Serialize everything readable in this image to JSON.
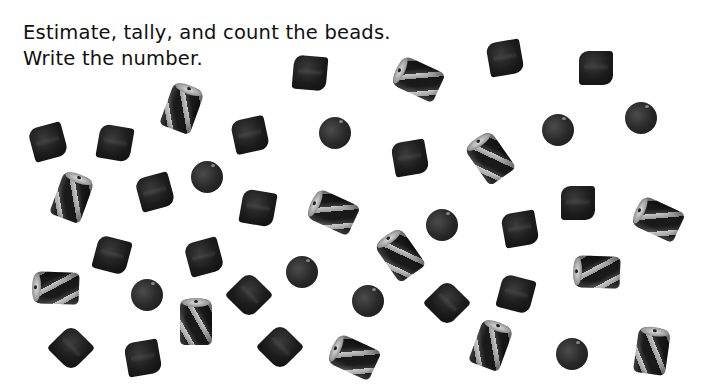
{
  "instructions": {
    "line1": "Estimate, tally, and count the beads.",
    "line2": "Write the number."
  },
  "bead_types": [
    "bicone",
    "round",
    "cylinder"
  ],
  "beads": [
    {
      "type": "bicone",
      "x": 310,
      "y": 73,
      "rot": 5
    },
    {
      "type": "cylinder",
      "x": 418,
      "y": 79,
      "rot": -65
    },
    {
      "type": "bicone",
      "x": 505,
      "y": 58,
      "rot": -10
    },
    {
      "type": "bicone",
      "x": 596,
      "y": 68,
      "rot": 0
    },
    {
      "type": "bicone",
      "x": 48,
      "y": 142,
      "rot": -15
    },
    {
      "type": "bicone",
      "x": 115,
      "y": 143,
      "rot": 10
    },
    {
      "type": "cylinder",
      "x": 182,
      "y": 108,
      "rot": 20
    },
    {
      "type": "bicone",
      "x": 250,
      "y": 135,
      "rot": -12
    },
    {
      "type": "round",
      "x": 335,
      "y": 133,
      "rot": 0
    },
    {
      "type": "bicone",
      "x": 410,
      "y": 158,
      "rot": -10
    },
    {
      "type": "cylinder",
      "x": 490,
      "y": 158,
      "rot": -35
    },
    {
      "type": "round",
      "x": 558,
      "y": 130,
      "rot": 0
    },
    {
      "type": "round",
      "x": 641,
      "y": 118,
      "rot": 0
    },
    {
      "type": "cylinder",
      "x": 72,
      "y": 197,
      "rot": 20
    },
    {
      "type": "bicone",
      "x": 155,
      "y": 192,
      "rot": -15
    },
    {
      "type": "round",
      "x": 207,
      "y": 177,
      "rot": 0
    },
    {
      "type": "bicone",
      "x": 258,
      "y": 208,
      "rot": 10
    },
    {
      "type": "cylinder",
      "x": 333,
      "y": 212,
      "rot": -65
    },
    {
      "type": "round",
      "x": 442,
      "y": 225,
      "rot": 0
    },
    {
      "type": "bicone",
      "x": 520,
      "y": 229,
      "rot": -10
    },
    {
      "type": "bicone",
      "x": 578,
      "y": 203,
      "rot": 0
    },
    {
      "type": "cylinder",
      "x": 658,
      "y": 219,
      "rot": -65
    },
    {
      "type": "bicone",
      "x": 112,
      "y": 255,
      "rot": 15
    },
    {
      "type": "bicone",
      "x": 204,
      "y": 257,
      "rot": -15
    },
    {
      "type": "round",
      "x": 302,
      "y": 272,
      "rot": 0
    },
    {
      "type": "cylinder",
      "x": 400,
      "y": 255,
      "rot": -35
    },
    {
      "type": "cylinder",
      "x": 56,
      "y": 288,
      "rot": -88
    },
    {
      "type": "round",
      "x": 147,
      "y": 295,
      "rot": 0
    },
    {
      "type": "cylinder",
      "x": 196,
      "y": 322,
      "rot": 0
    },
    {
      "type": "bicone",
      "x": 249,
      "y": 295,
      "rot": 45
    },
    {
      "type": "round",
      "x": 368,
      "y": 301,
      "rot": 0
    },
    {
      "type": "bicone",
      "x": 447,
      "y": 303,
      "rot": 45
    },
    {
      "type": "bicone",
      "x": 516,
      "y": 294,
      "rot": 15
    },
    {
      "type": "cylinder",
      "x": 597,
      "y": 272,
      "rot": -88
    },
    {
      "type": "bicone",
      "x": 71,
      "y": 348,
      "rot": 45
    },
    {
      "type": "bicone",
      "x": 143,
      "y": 358,
      "rot": -10
    },
    {
      "type": "bicone",
      "x": 280,
      "y": 347,
      "rot": 45
    },
    {
      "type": "cylinder",
      "x": 354,
      "y": 357,
      "rot": -65
    },
    {
      "type": "cylinder",
      "x": 491,
      "y": 345,
      "rot": 20
    },
    {
      "type": "round",
      "x": 572,
      "y": 354,
      "rot": 0
    },
    {
      "type": "cylinder",
      "x": 652,
      "y": 351,
      "rot": 8
    }
  ]
}
